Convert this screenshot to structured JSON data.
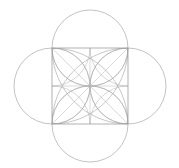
{
  "canvas": {
    "width": 179,
    "height": 168,
    "background": "#ffffff",
    "title": "geometric-rose-in-square"
  },
  "style": {
    "stroke_color": "#9a9a9a",
    "stroke_color_light": "#b4b4b4",
    "stroke_width": 0.6,
    "stroke_width_thin": 0.5,
    "fill": "none"
  },
  "chart_data": {
    "type": "scatter",
    "xlabel": "",
    "ylabel": "",
    "xlim": [
      0,
      179
    ],
    "ylim": [
      0,
      168
    ],
    "grid": false,
    "legend": "none",
    "annotations": [],
    "geometry": {
      "square": {
        "x": 52,
        "y": 48,
        "side": 76,
        "left": 52,
        "top": 48,
        "right": 128,
        "bottom": 124,
        "center_x": 90,
        "center_y": 86,
        "corners": [
          {
            "name": "top-left",
            "x": 52,
            "y": 48
          },
          {
            "name": "top-right",
            "x": 128,
            "y": 48
          },
          {
            "name": "bottom-right",
            "x": 128,
            "y": 124
          },
          {
            "name": "bottom-left",
            "x": 52,
            "y": 124
          }
        ],
        "edge_midpoints": [
          {
            "name": "top",
            "x": 90,
            "y": 48
          },
          {
            "name": "right",
            "x": 128,
            "y": 86
          },
          {
            "name": "bottom",
            "x": 90,
            "y": 124
          },
          {
            "name": "left",
            "x": 52,
            "y": 86
          }
        ]
      },
      "outer_circles": {
        "count": 4,
        "radius": 38,
        "centers": [
          {
            "name": "top-circle",
            "cx": 90,
            "cy": 48
          },
          {
            "name": "right-circle",
            "cx": 128,
            "cy": 86
          },
          {
            "name": "bottom-circle",
            "cx": 90,
            "cy": 124
          },
          {
            "name": "left-circle",
            "cx": 52,
            "cy": 86
          }
        ]
      },
      "corner_arcs_full": {
        "description": "quarter arcs radius equal to full side, centered at each square corner",
        "radius": 76,
        "centers": [
          {
            "name": "arc-from-top-left",
            "cx": 52,
            "cy": 48
          },
          {
            "name": "arc-from-top-right",
            "cx": 128,
            "cy": 48
          },
          {
            "name": "arc-from-bottom-right",
            "cx": 128,
            "cy": 124
          },
          {
            "name": "arc-from-bottom-left",
            "cx": 52,
            "cy": 124
          }
        ]
      },
      "corner_arcs_half": {
        "description": "arcs radius equal to half side, centered at each square corner",
        "radius": 38,
        "centers": [
          {
            "name": "halfarc-from-top-left",
            "cx": 52,
            "cy": 48
          },
          {
            "name": "halfarc-from-top-right",
            "cx": 128,
            "cy": 48
          },
          {
            "name": "halfarc-from-bottom-right",
            "cx": 128,
            "cy": 124
          },
          {
            "name": "halfarc-from-bottom-left",
            "cx": 52,
            "cy": 124
          }
        ]
      },
      "inner_petal_circles": {
        "description": "circles radius half side centered at edge midpoints forming inner rose",
        "radius": 38,
        "centers": [
          {
            "name": "petal-top",
            "cx": 90,
            "cy": 48
          },
          {
            "name": "petal-right",
            "cx": 128,
            "cy": 86
          },
          {
            "name": "petal-bottom",
            "cx": 90,
            "cy": 124
          },
          {
            "name": "petal-left",
            "cx": 52,
            "cy": 86
          }
        ]
      },
      "diagonals": {
        "description": "faint diagonals of the square",
        "lines": [
          {
            "name": "diagonal-tl-br",
            "x1": 52,
            "y1": 48,
            "x2": 128,
            "y2": 124
          },
          {
            "name": "diagonal-tr-bl",
            "x1": 128,
            "y1": 48,
            "x2": 52,
            "y2": 124
          }
        ]
      },
      "midlines": {
        "description": "horizontal and vertical center lines of the square",
        "lines": [
          {
            "name": "midline-horizontal",
            "x1": 52,
            "y1": 86,
            "x2": 128,
            "y2": 86
          },
          {
            "name": "midline-vertical",
            "x1": 90,
            "y1": 48,
            "x2": 90,
            "y2": 124
          }
        ]
      }
    }
  }
}
